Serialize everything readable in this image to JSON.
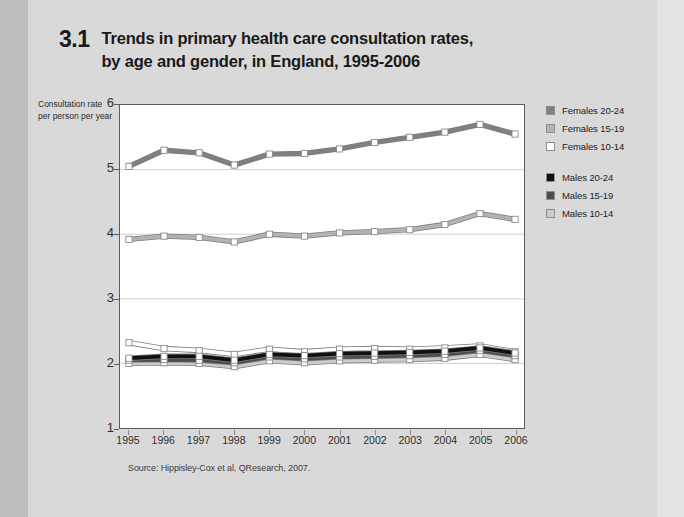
{
  "figure": {
    "number": "3.1",
    "title_line1": "Trends in primary health care consultation rates,",
    "title_line2": "by age and gender, in England, 1995-2006"
  },
  "axes": {
    "y_title_line1": "Consultation rate",
    "y_title_line2": "per person per year",
    "y_ticks": [
      "6",
      "5",
      "4",
      "3",
      "2",
      "1"
    ],
    "x_ticks": [
      "1995",
      "1996",
      "1997",
      "1998",
      "1999",
      "2000",
      "2001",
      "2002",
      "2003",
      "2004",
      "2005",
      "2006"
    ]
  },
  "legend": {
    "groups": [
      {
        "items": [
          {
            "label": "Females 20-24",
            "color": "#808080"
          },
          {
            "label": "Females 15-19",
            "color": "#b3b3b3"
          },
          {
            "label": "Females 10-14",
            "color": "#ffffff"
          }
        ]
      },
      {
        "items": [
          {
            "label": "Males 20-24",
            "color": "#111111"
          },
          {
            "label": "Males 15-19",
            "color": "#4d4d4d"
          },
          {
            "label": "Males 10-14",
            "color": "#cccccc"
          }
        ]
      }
    ]
  },
  "source": {
    "text": "Source: Hippisley-Cox et al, QResearch, 2007."
  },
  "chart_data": {
    "type": "line",
    "title": "Trends in primary health care consultation rates, by age and gender, in England, 1995-2006",
    "xlabel": "",
    "ylabel": "Consultation rate per person per year",
    "x": [
      "1995",
      "1996",
      "1997",
      "1998",
      "1999",
      "2000",
      "2001",
      "2002",
      "2003",
      "2004",
      "2005",
      "2006"
    ],
    "ylim": [
      1,
      6
    ],
    "yticks": [
      1,
      2,
      3,
      4,
      5,
      6
    ],
    "grid": "horizontal",
    "legend_position": "right",
    "markers": "square",
    "series": [
      {
        "name": "Females 20-24",
        "color": "#808080",
        "values": [
          5.05,
          5.3,
          5.26,
          5.07,
          5.24,
          5.25,
          5.32,
          5.42,
          5.5,
          5.58,
          5.7,
          5.55
        ]
      },
      {
        "name": "Females 15-19",
        "color": "#b3b3b3",
        "values": [
          3.92,
          3.97,
          3.95,
          3.88,
          4.0,
          3.97,
          4.02,
          4.04,
          4.07,
          4.15,
          4.32,
          4.23
        ]
      },
      {
        "name": "Females 10-14",
        "color": "#ffffff",
        "values": [
          2.32,
          2.23,
          2.2,
          2.14,
          2.22,
          2.18,
          2.22,
          2.23,
          2.22,
          2.24,
          2.27,
          2.18
        ]
      },
      {
        "name": "Males 20-24",
        "color": "#111111",
        "values": [
          2.08,
          2.11,
          2.11,
          2.05,
          2.14,
          2.12,
          2.15,
          2.16,
          2.17,
          2.19,
          2.24,
          2.16
        ]
      },
      {
        "name": "Males 15-19",
        "color": "#4d4d4d",
        "values": [
          2.05,
          2.06,
          2.05,
          2.01,
          2.1,
          2.07,
          2.1,
          2.11,
          2.12,
          2.14,
          2.2,
          2.12
        ]
      },
      {
        "name": "Males 10-14",
        "color": "#cccccc",
        "values": [
          2.0,
          2.01,
          2.0,
          1.95,
          2.04,
          2.01,
          2.04,
          2.05,
          2.06,
          2.08,
          2.14,
          2.06
        ]
      }
    ]
  }
}
